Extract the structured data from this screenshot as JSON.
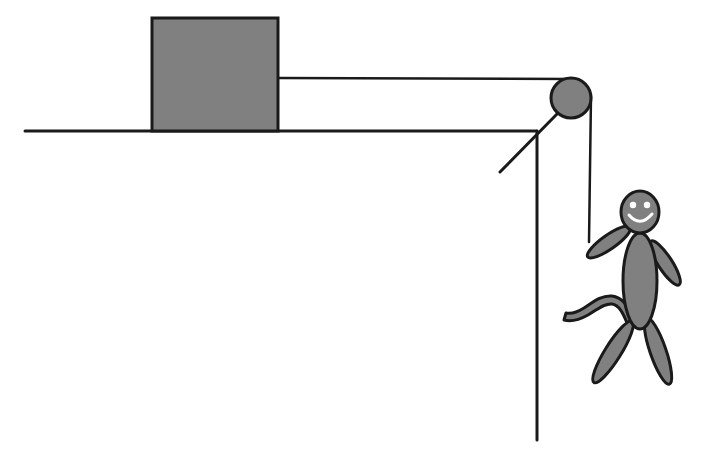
{
  "scene": {
    "title": "Pulley system with hanging person and block on table",
    "background_color": "#ffffff",
    "stroke_color": "#1a1a1a",
    "fill_color": "#808080",
    "face_color": "#ffffff",
    "canvas": {
      "width": 702,
      "height": 457
    }
  },
  "elements": {
    "ground": {
      "label": "table-top-surface",
      "x1": 25,
      "y1": 131,
      "x2": 537,
      "y2": 131,
      "stroke_width": 3
    },
    "wall": {
      "label": "table-edge-vertical",
      "x1": 537,
      "y1": 131,
      "x2": 537,
      "y2": 440,
      "stroke_width": 3
    },
    "block": {
      "label": "block-on-table",
      "x": 152,
      "y": 18,
      "width": 126,
      "height": 113,
      "stroke_width": 3
    },
    "rope_horizontal": {
      "label": "rope-block-to-pulley",
      "x1": 278,
      "y1": 78,
      "x2": 571,
      "y2": 78,
      "stroke_width": 2.5
    },
    "rope_vertical": {
      "label": "rope-pulley-to-hand",
      "x1": 591,
      "y1": 98,
      "x2": 589,
      "y2": 240,
      "stroke_width": 2.5
    },
    "pulley": {
      "label": "pulley-wheel",
      "cx": 571,
      "cy": 98,
      "r": 20,
      "stroke_width": 3
    },
    "support_strut": {
      "label": "pulley-support-bracket",
      "x1": 557,
      "y1": 114,
      "x2": 500,
      "y2": 172,
      "stroke_width": 3
    },
    "person": {
      "label": "stick-figure-person",
      "head": {
        "cx": 640,
        "cy": 212,
        "rx": 18,
        "ry": 20
      },
      "eye_left": {
        "cx": 633,
        "cy": 205,
        "r": 3
      },
      "eye_right": {
        "cx": 647,
        "cy": 205,
        "r": 3
      },
      "smile": {
        "path": "M 628 216 Q 640 229 652 215"
      },
      "torso": {
        "cx": 640,
        "cy": 280,
        "rx": 17,
        "ry": 48
      },
      "arm_left": {
        "x1": 628,
        "y1": 243,
        "x2": 589,
        "y2": 238,
        "thickness": 11
      },
      "arm_right": {
        "x1": 653,
        "y1": 245,
        "x2": 676,
        "y2": 281,
        "thickness": 11
      },
      "leg_left": {
        "x1": 632,
        "y1": 322,
        "x2": 595,
        "y2": 381,
        "thickness": 13
      },
      "leg_right": {
        "x1": 648,
        "y1": 322,
        "x2": 668,
        "y2": 380,
        "thickness": 13
      },
      "raised_leg": {
        "path": "M 632 320 L 612 300 L 591 311 L 570 316",
        "thickness": 8
      }
    }
  },
  "annotations": {
    "visible_text": []
  }
}
